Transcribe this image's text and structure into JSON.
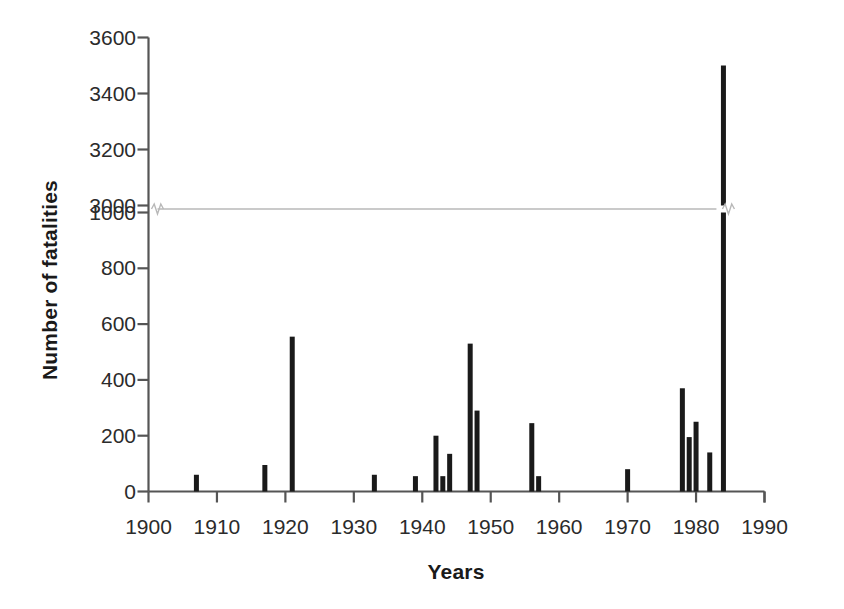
{
  "chart_data": {
    "type": "bar",
    "title": "",
    "xlabel": "Years",
    "ylabel": "Number of fatalities",
    "x": [
      1907,
      1917,
      1921,
      1933,
      1939,
      1942,
      1943,
      1944,
      1947,
      1948,
      1956,
      1957,
      1970,
      1978,
      1979,
      1980,
      1982,
      1984
    ],
    "values": [
      60,
      95,
      555,
      60,
      55,
      200,
      55,
      135,
      530,
      290,
      245,
      55,
      80,
      370,
      195,
      250,
      140,
      3500
    ],
    "xlim": [
      1900,
      1990
    ],
    "xticks": [
      1900,
      1910,
      1920,
      1930,
      1940,
      1950,
      1960,
      1970,
      1980,
      1990
    ],
    "xtick_labels": [
      "1900",
      "1910",
      "1920",
      "1930",
      "1940",
      "1950",
      "1960",
      "1970",
      "1980",
      "1990"
    ],
    "yticks": [
      0,
      200,
      400,
      600,
      800,
      1000,
      3000,
      3200,
      3400,
      3600
    ],
    "ytick_labels": [
      "0",
      "200",
      "400",
      "600",
      "800",
      "1000",
      "3000",
      "3200",
      "3400",
      "3600"
    ],
    "ylim": [
      0,
      3600
    ],
    "axis_break": {
      "present": true,
      "lower": 1000,
      "upper": 3000,
      "style": "zigzag"
    },
    "grid": false,
    "legend": null,
    "bar_color": "#1a1a1a",
    "axis_color": "#555555",
    "break_line_color": "#b8b8b8"
  },
  "axes": {
    "ylabel": "Number of fatalities",
    "xlabel": "Years"
  }
}
